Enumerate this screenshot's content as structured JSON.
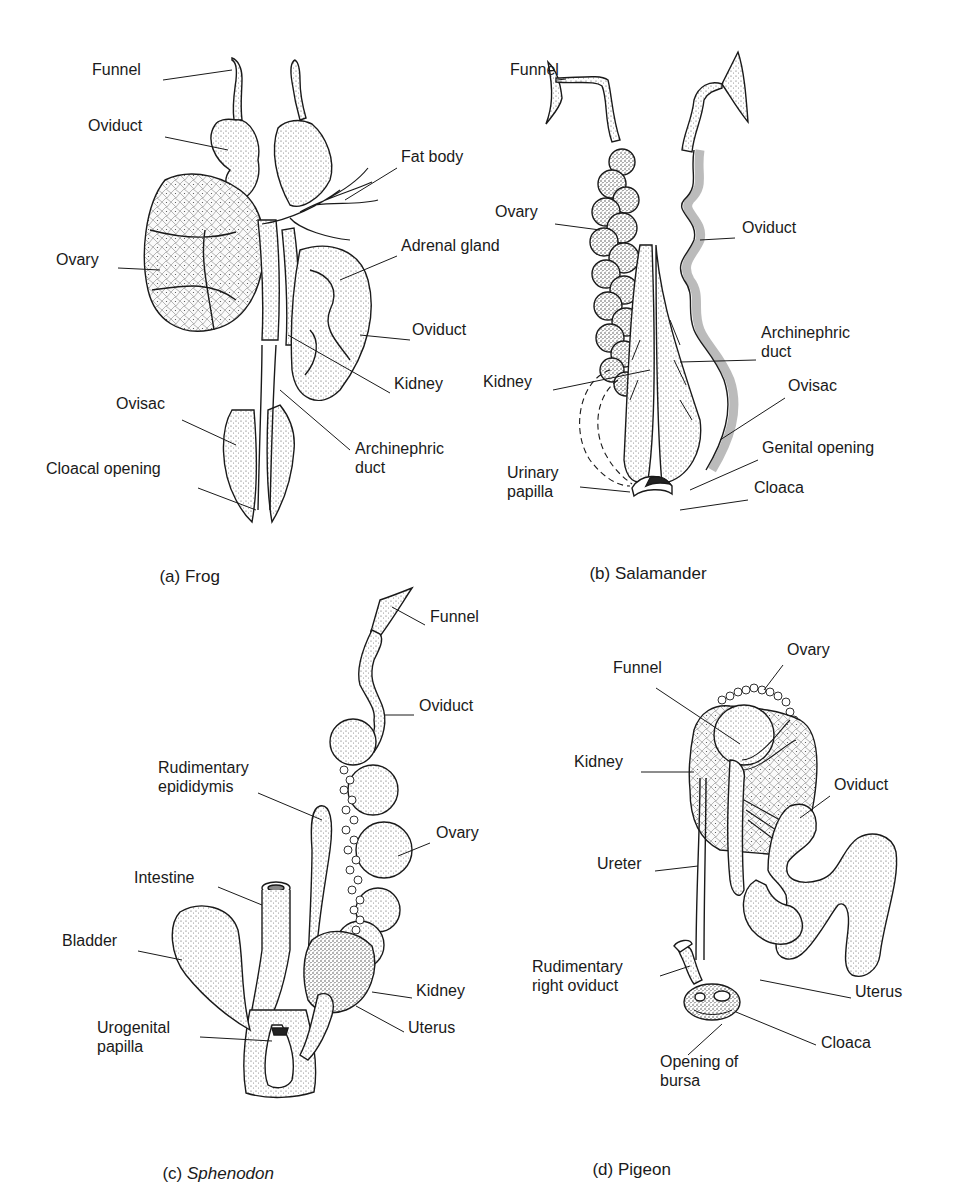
{
  "figure": {
    "panels": [
      {
        "id": "a",
        "caption_prefix": "(a) ",
        "caption_name": "Frog",
        "caption_italic": false,
        "labels": [
          {
            "text": "Funnel",
            "x": 92,
            "y": 69
          },
          {
            "text": "Oviduct",
            "x": 88,
            "y": 125
          },
          {
            "text": "Fat body",
            "x": 401,
            "y": 156
          },
          {
            "text": "Adrenal gland",
            "x": 401,
            "y": 245
          },
          {
            "text": "Ovary",
            "x": 56,
            "y": 259
          },
          {
            "text": "Oviduct",
            "x": 412,
            "y": 329
          },
          {
            "text": "Kidney",
            "x": 394,
            "y": 383
          },
          {
            "text": "Ovisac",
            "x": 116,
            "y": 403
          },
          {
            "text": "Archinephric\nduct",
            "x": 355,
            "y": 448
          },
          {
            "text": "Cloacal opening",
            "x": 46,
            "y": 468
          }
        ]
      },
      {
        "id": "b",
        "caption_prefix": "(b) ",
        "caption_name": "Salamander",
        "caption_italic": false,
        "labels": [
          {
            "text": "Funnel",
            "x": 510,
            "y": 69
          },
          {
            "text": "Ovary",
            "x": 495,
            "y": 211
          },
          {
            "text": "Oviduct",
            "x": 742,
            "y": 227
          },
          {
            "text": "Archinephric\nduct",
            "x": 761,
            "y": 332
          },
          {
            "text": "Kidney",
            "x": 483,
            "y": 381
          },
          {
            "text": "Ovisac",
            "x": 788,
            "y": 385
          },
          {
            "text": "Genital opening",
            "x": 762,
            "y": 447
          },
          {
            "text": "Urinary\npapilla",
            "x": 507,
            "y": 472
          },
          {
            "text": "Cloaca",
            "x": 754,
            "y": 487
          }
        ]
      },
      {
        "id": "c",
        "caption_prefix": "(c) ",
        "caption_name": "Sphenodon",
        "caption_italic": true,
        "labels": [
          {
            "text": "Funnel",
            "x": 430,
            "y": 616
          },
          {
            "text": "Oviduct",
            "x": 419,
            "y": 705
          },
          {
            "text": "Rudimentary\nepididymis",
            "x": 158,
            "y": 767
          },
          {
            "text": "Ovary",
            "x": 436,
            "y": 832
          },
          {
            "text": "Intestine",
            "x": 134,
            "y": 877
          },
          {
            "text": "Bladder",
            "x": 62,
            "y": 940
          },
          {
            "text": "Kidney",
            "x": 416,
            "y": 990
          },
          {
            "text": "Uterus",
            "x": 408,
            "y": 1027
          },
          {
            "text": "Urogenital\npapilla",
            "x": 97,
            "y": 1027
          }
        ]
      },
      {
        "id": "d",
        "caption_prefix": "(d) ",
        "caption_name": "Pigeon",
        "caption_italic": false,
        "labels": [
          {
            "text": "Ovary",
            "x": 787,
            "y": 649
          },
          {
            "text": "Funnel",
            "x": 613,
            "y": 667
          },
          {
            "text": "Kidney",
            "x": 574,
            "y": 761
          },
          {
            "text": "Oviduct",
            "x": 834,
            "y": 784
          },
          {
            "text": "Ureter",
            "x": 597,
            "y": 863
          },
          {
            "text": "Rudimentary\nright oviduct",
            "x": 532,
            "y": 966
          },
          {
            "text": "Uterus",
            "x": 855,
            "y": 991
          },
          {
            "text": "Cloaca",
            "x": 821,
            "y": 1042
          },
          {
            "text": "Opening of\nbursa",
            "x": 660,
            "y": 1061
          }
        ]
      }
    ]
  },
  "captions_pos": [
    {
      "x": 150,
      "y": 557
    },
    {
      "x": 580,
      "y": 554
    },
    {
      "x": 153,
      "y": 1154
    },
    {
      "x": 583,
      "y": 1150
    }
  ],
  "colors": {
    "ink": "#1a1a1a",
    "paper": "#ffffff",
    "stipple": "#d9d9d9"
  }
}
